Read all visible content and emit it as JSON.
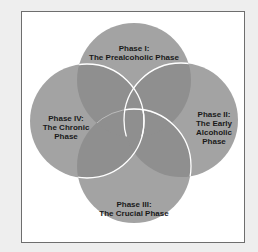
{
  "diagram": {
    "type": "four-circle-venn",
    "colors": {
      "circle_fill": "#a3a3a3",
      "overlap_fill": "#8f8f8f",
      "outline": "#ffffff",
      "frame_border": "#6e6e6e",
      "background": "#eeeeee"
    },
    "phases": [
      {
        "id": "phase-1",
        "position": "top",
        "lines": [
          "Phase I:",
          "The Prealcoholic Phase"
        ]
      },
      {
        "id": "phase-2",
        "position": "right",
        "lines": [
          "Phase II:",
          "The Early",
          "Alcoholic",
          "Phase"
        ]
      },
      {
        "id": "phase-3",
        "position": "bottom",
        "lines": [
          "Phase III:",
          "The Crucial Phase"
        ]
      },
      {
        "id": "phase-4",
        "position": "left",
        "lines": [
          "Phase IV:",
          "The Chronic",
          "Phase"
        ]
      }
    ]
  }
}
